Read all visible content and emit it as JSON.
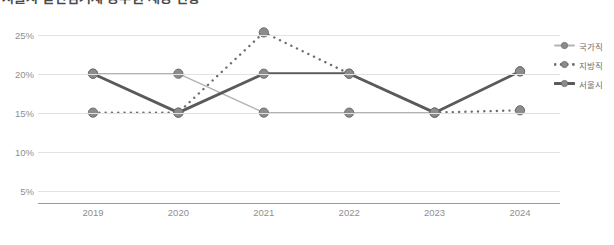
{
  "title": "서울시 일반임기제 공무원 채용 현황",
  "legend": {
    "position": "right",
    "items": [
      {
        "label": "국가직",
        "style": "solid-thin",
        "color": "#b3b3b3"
      },
      {
        "label": "지방직",
        "style": "dotted",
        "color": "#6e6e6e"
      },
      {
        "label": "서울시",
        "style": "solid-thick",
        "color": "#5a5a5a"
      }
    ]
  },
  "marker": {
    "fill": "#8c8c8c",
    "stroke": "#6e6e6e",
    "radius": 4.6
  },
  "axes": {
    "y_ticks": [
      "25%",
      "20%",
      "15%",
      "10%",
      "5%"
    ],
    "x_ticks": [
      "2019",
      "2020",
      "2021",
      "2022",
      "2023",
      "2024"
    ],
    "grid": true,
    "baseline_color": "#9a9a9a"
  },
  "chart_data": {
    "type": "line",
    "title": "서울시 일반임기제 공무원 채용 현황",
    "xlabel": "",
    "ylabel": "",
    "categories": [
      "2019",
      "2020",
      "2021",
      "2022",
      "2023",
      "2024"
    ],
    "ylim": [
      0,
      27
    ],
    "yticks": [
      5,
      10,
      15,
      20,
      25
    ],
    "ytick_labels": [
      "5%",
      "10%",
      "15%",
      "20%",
      "25%"
    ],
    "grid": true,
    "legend_position": "right",
    "series": [
      {
        "name": "국가직",
        "style": "solid-thin",
        "color": "#b3b3b3",
        "values": [
          20.0,
          20.0,
          15.0,
          15.0,
          15.0,
          20.3
        ]
      },
      {
        "name": "지방직",
        "style": "dotted",
        "color": "#6e6e6e",
        "values": [
          15.0,
          15.0,
          25.3,
          20.0,
          15.0,
          15.3
        ]
      },
      {
        "name": "서울시",
        "style": "solid-thick",
        "color": "#5a5a5a",
        "values": [
          20.0,
          15.0,
          20.0,
          20.0,
          15.0,
          20.3
        ]
      }
    ]
  }
}
